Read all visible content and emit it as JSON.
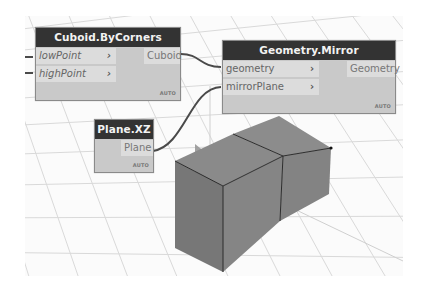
{
  "canvas": {
    "background": "#fbfbfb",
    "grid_color": "#d8d8d8"
  },
  "nodes": {
    "cuboid_by_corners": {
      "title": "Cuboid.ByCorners",
      "inputs": [
        {
          "label": "lowPoint",
          "chevron": "›"
        },
        {
          "label": "highPoint",
          "chevron": "›"
        }
      ],
      "outputs": [
        {
          "label": "Cuboid"
        }
      ],
      "lacing": "AUTO"
    },
    "geometry_mirror": {
      "title": "Geometry.Mirror",
      "inputs": [
        {
          "label": "geometry",
          "chevron": "›"
        },
        {
          "label": "mirrorPlane",
          "chevron": "›"
        }
      ],
      "outputs": [
        {
          "label": "Geometry"
        }
      ],
      "lacing": "AUTO"
    },
    "plane_xz": {
      "title": "Plane.XZ",
      "inputs": [],
      "outputs": [
        {
          "label": "Plane"
        }
      ],
      "lacing": "AUTO"
    }
  },
  "colors": {
    "node_header": "#333333",
    "node_body": "#c9c9c9",
    "port_bg": "#dcdcdc",
    "wire": "#555555",
    "solid_face_top": "#8a8a8a",
    "solid_face_left": "#7c7c7c",
    "solid_face_right": "#868686",
    "plane": "#9a9a9a"
  }
}
